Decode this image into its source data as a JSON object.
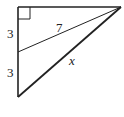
{
  "diagram": {
    "type": "right-triangle",
    "labels": {
      "upper_segment": "3",
      "lower_segment": "3",
      "cevian": "7",
      "hypotenuse": "x"
    },
    "stroke_color": "#222222"
  }
}
